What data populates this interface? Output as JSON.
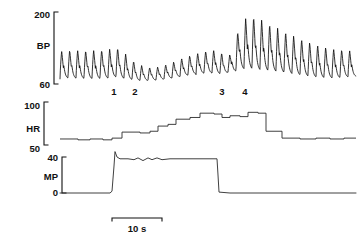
{
  "figure": {
    "title": "",
    "background_color": "#ffffff",
    "trace_color": "#0d0d0d"
  },
  "scale_bar": {
    "label": "10 s",
    "seconds": 10,
    "x_start_px": 112,
    "x_end_px": 162,
    "y_px": 218
  },
  "event_markers": [
    {
      "label": "1",
      "x_px": 114
    },
    {
      "label": "2",
      "x_px": 135
    },
    {
      "label": "3",
      "x_px": 222
    },
    {
      "label": "4",
      "x_px": 245
    }
  ],
  "channels": [
    {
      "name": "BP",
      "label": "BP",
      "unit": "mmHg",
      "axis_min": 60,
      "axis_max": 200,
      "tick_labels": [
        "200",
        "60"
      ],
      "tick_values": [
        200,
        60
      ]
    },
    {
      "name": "HR",
      "label": "HR",
      "unit": "beats/min",
      "axis_min": 50,
      "axis_max": 100,
      "tick_labels": [
        "100",
        "50"
      ],
      "tick_values": [
        100,
        50
      ]
    },
    {
      "name": "MP",
      "label": "MP",
      "unit": "W",
      "axis_min": 0,
      "axis_max": 40,
      "tick_labels": [
        "40",
        "0"
      ],
      "tick_values": [
        40,
        0
      ]
    }
  ],
  "chart_data": {
    "type": "line",
    "title": "",
    "subtitle": "",
    "xlabel": "",
    "ylabel": "",
    "grid": false,
    "legend": "none",
    "x_scale_note": "10 s scale bar spans 50 px; approx 5 px per second",
    "annotations": [
      {
        "text": "1",
        "x_px": 114,
        "y_px": 88
      },
      {
        "text": "2",
        "x_px": 135,
        "y_px": 88
      },
      {
        "text": "3",
        "x_px": 222,
        "y_px": 88
      },
      {
        "text": "4",
        "x_px": 245,
        "y_px": 88
      }
    ],
    "panels": [
      {
        "name": "BP",
        "label": "BP",
        "type": "line",
        "ylabel": "BP",
        "ylim": [
          60,
          200
        ],
        "yticks": [
          60,
          200
        ],
        "ytick_labels": [
          "60",
          "200"
        ],
        "plot_x_px": [
          60,
          356
        ],
        "plot_y_px": [
          12,
          84
        ],
        "description": "Pulsatile arterial blood pressure. Steady oscillation 68-125 mmHg at rest, dip after marker 1-2 to 66-95, gradual recovery, sharp rise after markers 3-4 peaking near 195, then slow decline.",
        "beats_per_pixel": 0.125,
        "envelope": [
          {
            "x_px": 60,
            "systolic": 124,
            "diastolic": 70
          },
          {
            "x_px": 72,
            "systolic": 126,
            "diastolic": 70
          },
          {
            "x_px": 86,
            "systolic": 125,
            "diastolic": 69
          },
          {
            "x_px": 100,
            "systolic": 126,
            "diastolic": 69
          },
          {
            "x_px": 110,
            "systolic": 128,
            "diastolic": 70
          },
          {
            "x_px": 116,
            "systolic": 132,
            "diastolic": 72
          },
          {
            "x_px": 122,
            "systolic": 125,
            "diastolic": 70
          },
          {
            "x_px": 130,
            "systolic": 110,
            "diastolic": 68
          },
          {
            "x_px": 138,
            "systolic": 98,
            "diastolic": 66
          },
          {
            "x_px": 148,
            "systolic": 92,
            "diastolic": 66
          },
          {
            "x_px": 158,
            "systolic": 93,
            "diastolic": 67
          },
          {
            "x_px": 170,
            "systolic": 100,
            "diastolic": 70
          },
          {
            "x_px": 182,
            "systolic": 110,
            "diastolic": 74
          },
          {
            "x_px": 194,
            "systolic": 118,
            "diastolic": 78
          },
          {
            "x_px": 206,
            "systolic": 124,
            "diastolic": 80
          },
          {
            "x_px": 216,
            "systolic": 126,
            "diastolic": 80
          },
          {
            "x_px": 222,
            "systolic": 120,
            "diastolic": 78
          },
          {
            "x_px": 228,
            "systolic": 108,
            "diastolic": 82
          },
          {
            "x_px": 234,
            "systolic": 140,
            "diastolic": 82
          },
          {
            "x_px": 240,
            "systolic": 175,
            "diastolic": 86
          },
          {
            "x_px": 248,
            "systolic": 193,
            "diastolic": 88
          },
          {
            "x_px": 256,
            "systolic": 190,
            "diastolic": 86
          },
          {
            "x_px": 266,
            "systolic": 180,
            "diastolic": 84
          },
          {
            "x_px": 278,
            "systolic": 168,
            "diastolic": 82
          },
          {
            "x_px": 292,
            "systolic": 155,
            "diastolic": 78
          },
          {
            "x_px": 306,
            "systolic": 143,
            "diastolic": 74
          },
          {
            "x_px": 320,
            "systolic": 134,
            "diastolic": 71
          },
          {
            "x_px": 334,
            "systolic": 128,
            "diastolic": 70
          },
          {
            "x_px": 346,
            "systolic": 126,
            "diastolic": 72
          },
          {
            "x_px": 356,
            "systolic": 124,
            "diastolic": 74
          }
        ]
      },
      {
        "name": "HR",
        "label": "HR",
        "type": "step",
        "ylabel": "HR",
        "ylim": [
          50,
          100
        ],
        "yticks": [
          50,
          100
        ],
        "ytick_labels": [
          "50",
          "100"
        ],
        "plot_x_px": [
          60,
          356
        ],
        "plot_y_px": [
          102,
          145
        ],
        "description": "Beat-to-beat heart rate as staircase. Resting near 57, rises stepwise to about 88 during exercise, abrupt fall after work stops, returning to about 56.",
        "steps": [
          {
            "x_px": 60,
            "value": 57
          },
          {
            "x_px": 78,
            "value": 56
          },
          {
            "x_px": 90,
            "value": 57
          },
          {
            "x_px": 103,
            "value": 56
          },
          {
            "x_px": 112,
            "value": 58
          },
          {
            "x_px": 122,
            "value": 65
          },
          {
            "x_px": 140,
            "value": 64
          },
          {
            "x_px": 150,
            "value": 66
          },
          {
            "x_px": 158,
            "value": 72
          },
          {
            "x_px": 168,
            "value": 74
          },
          {
            "x_px": 176,
            "value": 80
          },
          {
            "x_px": 190,
            "value": 82
          },
          {
            "x_px": 200,
            "value": 87
          },
          {
            "x_px": 214,
            "value": 86
          },
          {
            "x_px": 222,
            "value": 82
          },
          {
            "x_px": 230,
            "value": 84
          },
          {
            "x_px": 240,
            "value": 83
          },
          {
            "x_px": 248,
            "value": 88
          },
          {
            "x_px": 258,
            "value": 87
          },
          {
            "x_px": 266,
            "value": 66
          },
          {
            "x_px": 282,
            "value": 58
          },
          {
            "x_px": 300,
            "value": 57
          },
          {
            "x_px": 316,
            "value": 58
          },
          {
            "x_px": 330,
            "value": 57
          },
          {
            "x_px": 344,
            "value": 58
          },
          {
            "x_px": 356,
            "value": 58
          }
        ]
      },
      {
        "name": "MP",
        "label": "MP",
        "type": "line",
        "ylabel": "MP",
        "ylim": [
          0,
          40
        ],
        "yticks": [
          0,
          40
        ],
        "ytick_labels": [
          "0",
          "40"
        ],
        "plot_x_px": [
          60,
          356
        ],
        "plot_y_px": [
          157,
          193
        ],
        "description": "Mouth pressure / work rate. Flat at 0, abrupt step up at marker 1 with overshoot to about 46, plateau near 38, abrupt return to 0 just after marker 2 region at x 218.",
        "points": [
          {
            "x_px": 60,
            "value": 0
          },
          {
            "x_px": 110,
            "value": 0
          },
          {
            "x_px": 112,
            "value": 2
          },
          {
            "x_px": 114,
            "value": 30
          },
          {
            "x_px": 115,
            "value": 46
          },
          {
            "x_px": 117,
            "value": 40
          },
          {
            "x_px": 120,
            "value": 38
          },
          {
            "x_px": 128,
            "value": 38
          },
          {
            "x_px": 134,
            "value": 37
          },
          {
            "x_px": 138,
            "value": 39
          },
          {
            "x_px": 143,
            "value": 36
          },
          {
            "x_px": 148,
            "value": 39
          },
          {
            "x_px": 152,
            "value": 37
          },
          {
            "x_px": 157,
            "value": 39
          },
          {
            "x_px": 162,
            "value": 37
          },
          {
            "x_px": 170,
            "value": 38
          },
          {
            "x_px": 182,
            "value": 38
          },
          {
            "x_px": 196,
            "value": 38
          },
          {
            "x_px": 210,
            "value": 38
          },
          {
            "x_px": 217,
            "value": 38
          },
          {
            "x_px": 218,
            "value": 20
          },
          {
            "x_px": 219,
            "value": 1
          },
          {
            "x_px": 230,
            "value": 0
          },
          {
            "x_px": 280,
            "value": 0
          },
          {
            "x_px": 356,
            "value": 0
          }
        ]
      }
    ]
  }
}
